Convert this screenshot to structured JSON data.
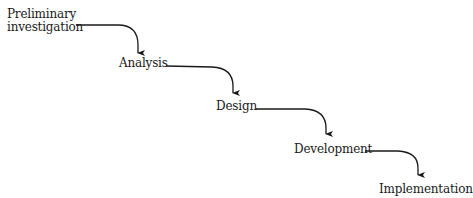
{
  "diagram": {
    "type": "waterfall",
    "stages": [
      {
        "id": "preliminary",
        "label_line1": "Preliminary",
        "label_line2": "investigation"
      },
      {
        "id": "analysis",
        "label": "Analysis"
      },
      {
        "id": "design",
        "label": "Design"
      },
      {
        "id": "development",
        "label": "Development"
      },
      {
        "id": "implementation",
        "label": "Implementation"
      }
    ],
    "edges": [
      {
        "from": "preliminary",
        "to": "analysis"
      },
      {
        "from": "analysis",
        "to": "design"
      },
      {
        "from": "design",
        "to": "development"
      },
      {
        "from": "development",
        "to": "implementation"
      }
    ],
    "colors": {
      "text": "#1a1a1a",
      "arrow": "#1a1a1a",
      "background": "#ffffff"
    }
  }
}
